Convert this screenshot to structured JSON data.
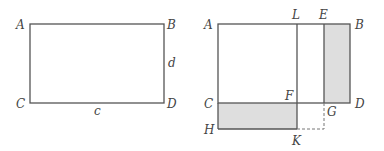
{
  "colors": {
    "line": "#555555",
    "shade": "#dedede",
    "dashed": "#777777",
    "label": "#444444"
  },
  "left_figure": {
    "vertices": {
      "A": "A",
      "B": "B",
      "C": "C",
      "D": "D"
    },
    "side_labels": {
      "bottom": "c",
      "right": "d"
    }
  },
  "right_figure": {
    "vertices": {
      "A": "A",
      "L": "L",
      "E": "E",
      "B": "B",
      "C": "C",
      "F": "F",
      "G": "G",
      "D": "D",
      "H": "H",
      "K": "K"
    },
    "shaded_regions": [
      "EBDG",
      "CFKH"
    ],
    "dashed_segments": [
      "GK-vertical",
      "K-to-below-G"
    ]
  }
}
